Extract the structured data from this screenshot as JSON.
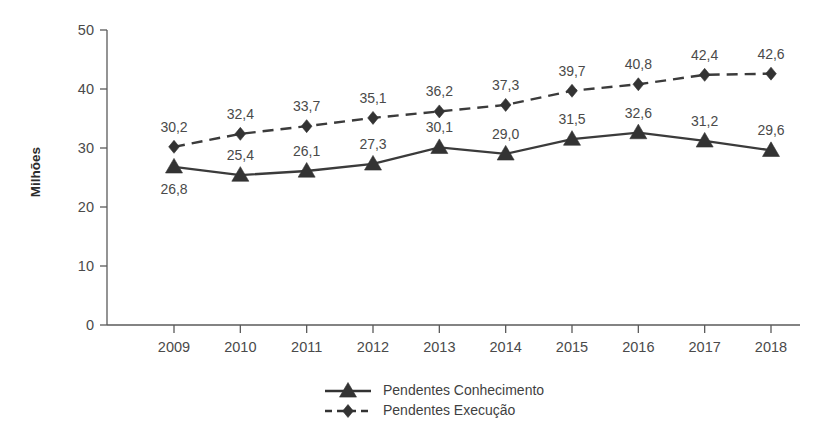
{
  "chart_data": {
    "type": "line",
    "title": "",
    "subtitle": "",
    "xlabel": "",
    "ylabel": "Milhões",
    "categories": [
      "2009",
      "2010",
      "2011",
      "2012",
      "2013",
      "2014",
      "2015",
      "2016",
      "2017",
      "2018"
    ],
    "x": [
      2009,
      2010,
      2011,
      2012,
      2013,
      2014,
      2015,
      2016,
      2017,
      2018
    ],
    "ylim": [
      0,
      50
    ],
    "yticks": [
      0,
      10,
      20,
      30,
      40,
      50
    ],
    "ytick_labels": [
      "0",
      "10",
      "20",
      "30",
      "40",
      "50"
    ],
    "grid": false,
    "legend_position": "bottom-center",
    "series": [
      {
        "name": "Pendentes Conhecimento",
        "marker": "triangle",
        "linestyle": "solid",
        "color": "#333333",
        "values": [
          26.8,
          25.4,
          26.1,
          27.3,
          30.1,
          29.0,
          31.5,
          32.6,
          31.2,
          29.6
        ],
        "labels": [
          "26,8",
          "25,4",
          "26,1",
          "27,3",
          "30,1",
          "29,0",
          "31,5",
          "32,6",
          "31,2",
          "29,6"
        ],
        "label_positions": [
          "below",
          "above",
          "above",
          "above",
          "above",
          "above",
          "above",
          "above",
          "above",
          "above"
        ]
      },
      {
        "name": "Pendentes Execução",
        "marker": "diamond",
        "linestyle": "dashed",
        "color": "#333333",
        "values": [
          30.2,
          32.4,
          33.7,
          35.1,
          36.2,
          37.3,
          39.7,
          40.8,
          42.4,
          42.6
        ],
        "labels": [
          "30,2",
          "32,4",
          "33,7",
          "35,1",
          "36,2",
          "37,3",
          "39,7",
          "40,8",
          "42,4",
          "42,6"
        ],
        "label_positions": [
          "above",
          "above",
          "above",
          "above",
          "above",
          "above",
          "above",
          "above",
          "above",
          "above"
        ]
      }
    ]
  },
  "legend": {
    "items": [
      {
        "label": "Pendentes Conhecimento",
        "marker": "triangle",
        "linestyle": "solid"
      },
      {
        "label": "Pendentes Execução",
        "marker": "diamond",
        "linestyle": "dashed"
      }
    ]
  },
  "colors": {
    "background": "#ffffff",
    "line": "#333333",
    "axis": "#5a5a5a",
    "text": "#4a4a4a"
  }
}
